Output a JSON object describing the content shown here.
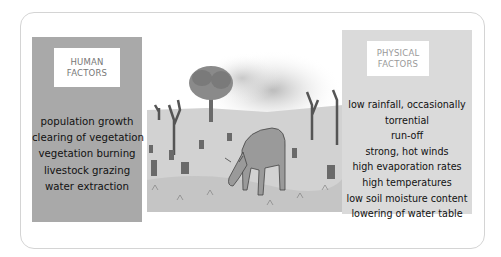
{
  "human_factors": {
    "header": [
      "HUMAN",
      "FACTORS"
    ],
    "items": [
      "population growth",
      "clearing of vegetation",
      "vegetation burning",
      "livestock grazing",
      "water extraction"
    ]
  },
  "physical_factors": {
    "header": [
      "PHYSICAL",
      "FACTORS"
    ],
    "items": [
      "low rainfall, occasionally",
      "torrential",
      "run-off",
      "strong, hot winds",
      "high evaporation rates",
      "high temperatures",
      "low soil moisture content",
      "lowering of water table"
    ]
  },
  "illustration": {
    "subject": "cow grazing on degraded land with tree stumps, dead trees and smoke from burning"
  },
  "colors": {
    "human_panel": "#a9a9a9",
    "physical_panel": "#dadada",
    "frame_border": "#d4d4d4"
  }
}
